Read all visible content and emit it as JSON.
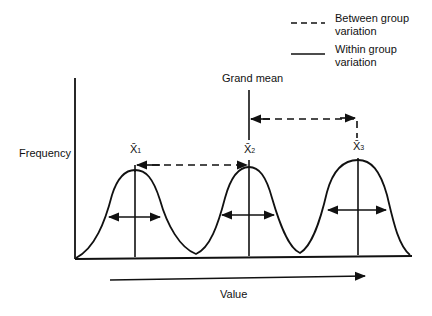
{
  "legend": {
    "between": {
      "line": "dashed",
      "label_1": "Between group",
      "label_2": "variation"
    },
    "within": {
      "line": "solid",
      "label_1": "Within group",
      "label_2": "variation"
    }
  },
  "labels": {
    "grand_mean": "Grand mean",
    "y_axis": "Frequency",
    "x_axis": "Value",
    "means": [
      {
        "symbol": "X̄",
        "sub": "1"
      },
      {
        "symbol": "X̄",
        "sub": "2"
      },
      {
        "symbol": "X̄",
        "sub": "3"
      }
    ]
  },
  "colors": {
    "ink": "#111111",
    "background": "#ffffff"
  }
}
